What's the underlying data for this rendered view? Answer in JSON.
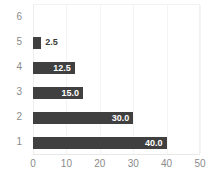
{
  "chart_data": {
    "type": "bar",
    "orientation": "horizontal",
    "title": "",
    "xlabel": "",
    "ylabel": "",
    "categories": [
      "6",
      "5",
      "4",
      "3",
      "2",
      "1"
    ],
    "values": [
      null,
      2.5,
      12.5,
      15.0,
      30.0,
      40.0
    ],
    "data_labels": [
      "",
      "2.5",
      "12.5",
      "15.0",
      "30.0",
      "40.0"
    ],
    "label_placement": [
      "none",
      "outside",
      "inside",
      "inside",
      "inside",
      "inside"
    ],
    "xlim": [
      0,
      50
    ],
    "xticks": [
      0,
      10,
      20,
      30,
      40,
      50
    ],
    "xticklabels": [
      "0",
      "10",
      "20",
      "30",
      "40",
      "50"
    ],
    "yticklabels": [
      "6",
      "5",
      "4",
      "3",
      "2",
      "1"
    ],
    "grid": true,
    "grid_axis": "x",
    "legend": false,
    "series": [
      {
        "name": "values",
        "points": [
          {
            "category": "6",
            "value": null,
            "label": ""
          },
          {
            "category": "5",
            "value": 2.5,
            "label": "2.5"
          },
          {
            "category": "4",
            "value": 12.5,
            "label": "12.5"
          },
          {
            "category": "3",
            "value": 15.0,
            "label": "15.0"
          },
          {
            "category": "2",
            "value": 30.0,
            "label": "30.0"
          },
          {
            "category": "1",
            "value": 40.0,
            "label": "40.0"
          }
        ]
      }
    ],
    "colors": {
      "bar": "#404040",
      "background": "#ffffff",
      "gridline": "#f4f4f4",
      "axis_text": "#8a8a8a",
      "label_inside": "#ffffff",
      "label_outside": "#3a3a3a"
    }
  }
}
